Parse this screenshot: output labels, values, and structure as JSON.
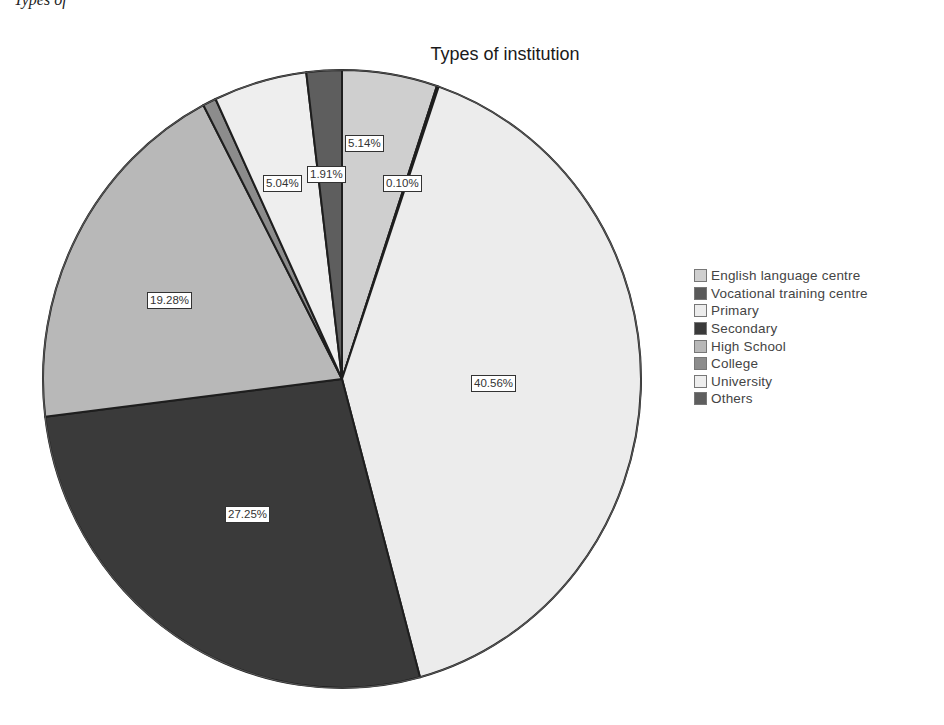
{
  "caption": "Types of",
  "chart_data": {
    "type": "pie",
    "title": "Types of institution",
    "start_angle_deg": 0,
    "direction": "clockwise",
    "categories": [
      "English language centre",
      "Vocational training centre",
      "Primary",
      "Secondary",
      "High School",
      "College",
      "University",
      "Others"
    ],
    "values": [
      5.14,
      0.1,
      40.56,
      27.25,
      19.28,
      0.72,
      5.04,
      1.91
    ],
    "labels": [
      "5.14%",
      "0.10%",
      "40.56%",
      "27.25%",
      "19.28%",
      "",
      "5.04%",
      "1.91%"
    ],
    "colors": [
      "#cfcfcf",
      "#5a5a5a",
      "#ececec",
      "#3a3a3a",
      "#b8b8b8",
      "#8c8c8c",
      "#eeeeee",
      "#5e5e5e"
    ],
    "legend_position": "right",
    "unit": "%"
  },
  "legend": {
    "items": [
      {
        "label": "English language centre",
        "color": "#cfcfcf"
      },
      {
        "label": "Vocational training centre",
        "color": "#5a5a5a"
      },
      {
        "label": "Primary",
        "color": "#ececec"
      },
      {
        "label": "Secondary",
        "color": "#3a3a3a"
      },
      {
        "label": "High School",
        "color": "#b8b8b8"
      },
      {
        "label": "College",
        "color": "#8c8c8c"
      },
      {
        "label": "University",
        "color": "#eeeeee"
      },
      {
        "label": "Others",
        "color": "#5e5e5e"
      }
    ]
  },
  "slice_labels": [
    {
      "text": "5.14%",
      "x": 345,
      "y": 135
    },
    {
      "text": "0.10%",
      "x": 383,
      "y": 175
    },
    {
      "text": "40.56%",
      "x": 471,
      "y": 375
    },
    {
      "text": "27.25%",
      "x": 225,
      "y": 506
    },
    {
      "text": "19.28%",
      "x": 147,
      "y": 292
    },
    {
      "text": "5.04%",
      "x": 263,
      "y": 175
    },
    {
      "text": "1.91%",
      "x": 307,
      "y": 166
    }
  ]
}
